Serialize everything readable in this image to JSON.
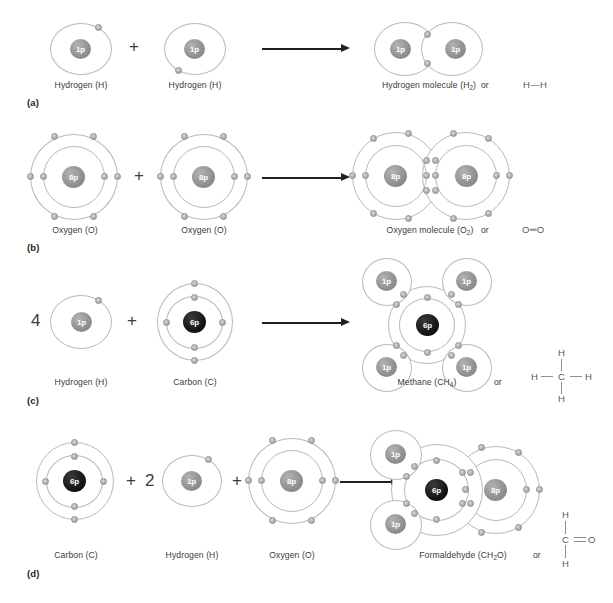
{
  "figure": {
    "background": "#ffffff",
    "nucleus_grey": "#939194",
    "nucleus_dark": "#000000",
    "shell_color": "#b9b8bb",
    "electron_color": "#b4b3b6",
    "arrow_color": "#231f20",
    "text_color": "#3b3a3c"
  },
  "panels": [
    {
      "letter": "(a)",
      "reactants": [
        {
          "label": "Hydrogen (H)",
          "nucleus": "1p",
          "shells": 1,
          "electrons": 1
        },
        {
          "label": "Hydrogen (H)",
          "nucleus": "1p",
          "shells": 1,
          "electrons": 1
        }
      ],
      "product": {
        "label_main": "Hydrogen molecule (H",
        "label_sub": "2",
        "label_end": ")"
      },
      "or_label": "or",
      "structural_formula": "H—H",
      "operators": [
        "+"
      ],
      "multiplier": ""
    },
    {
      "letter": "(b)",
      "reactants": [
        {
          "label": "Oxygen (O)",
          "nucleus": "8p",
          "shells": 2,
          "electrons": 8
        },
        {
          "label": "Oxygen (O)",
          "nucleus": "8p",
          "shells": 2,
          "electrons": 8
        }
      ],
      "product": {
        "label_main": "Oxygen molecule (O",
        "label_sub": "2",
        "label_end": ")"
      },
      "or_label": "or",
      "structural_formula": "O═O",
      "operators": [
        "+"
      ],
      "multiplier": ""
    },
    {
      "letter": "(c)",
      "reactants": [
        {
          "label": "Hydrogen (H)",
          "nucleus": "1p",
          "shells": 1,
          "electrons": 1
        },
        {
          "label": "Carbon (C)",
          "nucleus": "6p",
          "shells": 2,
          "electrons": 6
        }
      ],
      "product": {
        "label_main": "Methane (CH",
        "label_sub": "4",
        "label_end": ")"
      },
      "or_label": "or",
      "structural_formula": "H-C(H)(H)-H",
      "structural_atoms": [
        "H",
        "H",
        "C",
        "H",
        "H"
      ],
      "operators": [
        "+"
      ],
      "multiplier": "4"
    },
    {
      "letter": "(d)",
      "reactants": [
        {
          "label": "Carbon (C)",
          "nucleus": "6p",
          "shells": 2,
          "electrons": 6
        },
        {
          "label": "Hydrogen (H)",
          "nucleus": "1p",
          "shells": 1,
          "electrons": 1
        },
        {
          "label": "Oxygen (O)",
          "nucleus": "8p",
          "shells": 2,
          "electrons": 8
        }
      ],
      "product": {
        "label_main": "Formaldehyde (CH",
        "label_sub": "2",
        "label_end": "O)"
      },
      "or_label": "or",
      "structural_formula": "H-C(=O)-H",
      "structural_atoms": [
        "H",
        "C",
        "O",
        "H"
      ],
      "operators": [
        "+",
        "+"
      ],
      "multiplier": "2"
    }
  ],
  "labels": {
    "a_letter": "(a)",
    "b_letter": "(b)",
    "c_letter": "(c)",
    "d_letter": "(d)",
    "hydrogen": "Hydrogen (H)",
    "oxygen": "Oxygen (O)",
    "carbon": "Carbon (C)",
    "or": "or",
    "plus": "+",
    "four": "4",
    "two": "2",
    "h_h": "H—H",
    "o_o": "O═O",
    "nuc_1p": "1p",
    "nuc_6p": "6p",
    "nuc_8p": "8p",
    "atom_H": "H",
    "atom_C": "C",
    "atom_O": "O",
    "hyd_mol_main": "Hydrogen molecule (H",
    "hyd_mol_sub": "2",
    "hyd_mol_end": ")",
    "oxy_mol_main": "Oxygen molecule (O",
    "oxy_mol_sub": "2",
    "oxy_mol_end": ")",
    "methane_main": "Methane (CH",
    "methane_sub": "4",
    "methane_end": ")",
    "formal_main": "Formaldehyde (CH",
    "formal_sub": "2",
    "formal_end": "O)"
  }
}
